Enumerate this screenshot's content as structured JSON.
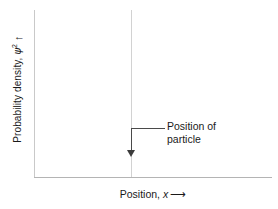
{
  "figure": {
    "background_color": "#ffffff",
    "axis_color": "#c9c9c9",
    "particle_line_color": "#d2d2d2",
    "annotation_color": "#3b3b3b",
    "text_color": "#1a1a1a"
  },
  "axes": {
    "y": {
      "label_text": "Probability density, ",
      "label_symbol": "ψ",
      "label_superscript": "2",
      "arrow": "↑"
    },
    "x": {
      "label_text": "Position, ",
      "label_symbol": "x",
      "arrow": "⟶"
    }
  },
  "annotation": {
    "line1": "Position of",
    "line2": "particle"
  },
  "chart_data": {
    "type": "line",
    "title": "",
    "xlabel": "Position, x",
    "ylabel": "Probability density, ψ²",
    "grid": false,
    "legend": null,
    "xlim": [
      0,
      1
    ],
    "ylim": [
      0,
      1
    ],
    "tick_labels": {
      "x": [],
      "y": []
    },
    "series": [
      {
        "name": "Position of particle",
        "description": "Single vertical spike (delta function) marking the exact position of the particle; probability density is zero everywhere else.",
        "x": [
          0.408
        ],
        "values": [
          1.0
        ],
        "style": "vertical-line"
      }
    ],
    "annotations": [
      {
        "text": "Position of particle",
        "points_to_x": 0.408,
        "points_to_y": 0.16,
        "arrow": "down"
      }
    ]
  }
}
